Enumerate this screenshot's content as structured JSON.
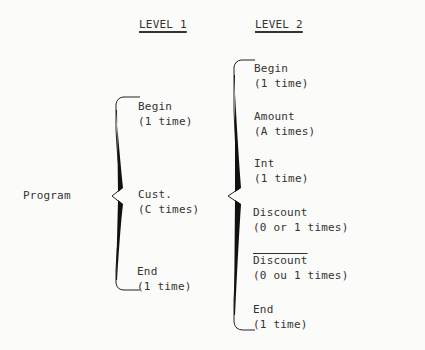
{
  "headers": {
    "level1": "LEVEL 1",
    "level2": "LEVEL 2"
  },
  "root": {
    "label": "Program"
  },
  "level1": [
    {
      "name": "Begin",
      "count": "(1 time)"
    },
    {
      "name": "Cust.",
      "count": "(C times)"
    },
    {
      "name": "End",
      "count": "(1 time)"
    }
  ],
  "level2": [
    {
      "name": "Begin",
      "count": "(1 time)"
    },
    {
      "name": "Amount",
      "count": "(A times)"
    },
    {
      "name": "Int",
      "count": "(1 time)"
    },
    {
      "name": "Discount",
      "count": "(0 or 1 times)"
    },
    {
      "name": "Discount",
      "count": "(0 ou 1 times)",
      "negated": true
    },
    {
      "name": "End",
      "count": "(1 time)"
    }
  ]
}
